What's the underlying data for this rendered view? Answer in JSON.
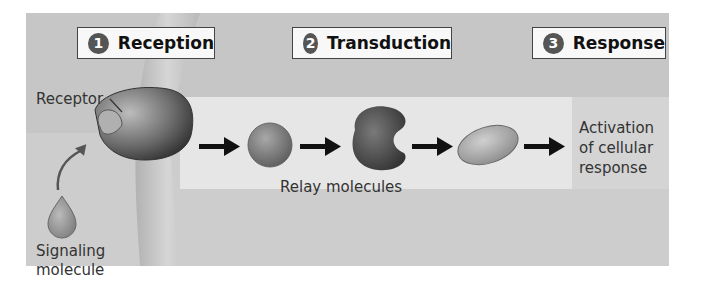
{
  "steps": [
    {
      "number": "1",
      "label": "Reception"
    },
    {
      "number": "2",
      "label": "Transduction"
    },
    {
      "number": "3",
      "label": "Response"
    }
  ],
  "labels": {
    "receptor": "Receptor",
    "signaling_line1": "Signaling",
    "signaling_line2": "molecule",
    "relay": "Relay molecules",
    "response_line1": "Activation",
    "response_line2": "of cellular",
    "response_line3": "response"
  },
  "colors": {
    "panel": "#c6c6c6",
    "relay_box": "#e6e6e6",
    "molecule_dark": "#4a4a4a",
    "molecule_mid": "#8a8a8a",
    "arrow": "#111111"
  }
}
